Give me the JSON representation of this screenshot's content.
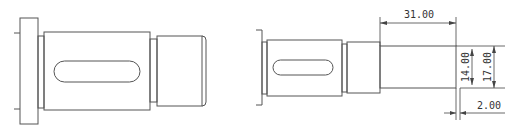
{
  "drawing": {
    "views": [
      {
        "name": "left-shaft-view",
        "description": "Original shaft with flange, keyway body and end journal"
      },
      {
        "name": "right-shaft-view",
        "description": "Shaft with added stepped end section and dimensions"
      }
    ],
    "dimensions": {
      "length_label": "31.00",
      "inner_diameter_label": "14.00",
      "outer_diameter_label": "17.00",
      "step_label": "2.00"
    },
    "colors": {
      "line": "#555555",
      "background": "#ffffff"
    }
  }
}
